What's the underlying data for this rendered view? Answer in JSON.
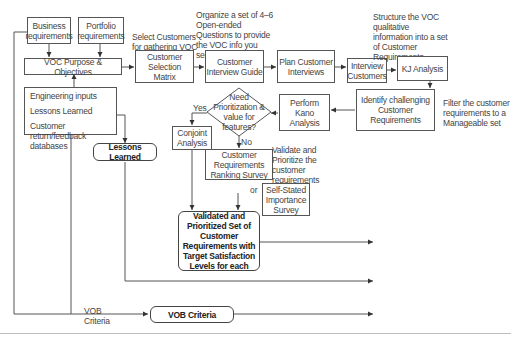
{
  "diagram": {
    "boxes": {
      "business_requirements": "Business requirements",
      "portfolio_requirements": "Portfolio requirements",
      "voc_purpose": "VOC Purpose & Objectives",
      "customer_selection_matrix": "Customer Selection Matrix",
      "customer_interview_guide": "Customer Interview Guide",
      "plan_customer_interviews": "Plan Customer Interviews",
      "interview_customers": "Interview Customers",
      "kj_analysis": "KJ Analysis",
      "identify_challenging": "Identify challenging Customer Requirements",
      "perform_kano": "Perform Kano Analysis",
      "conjoint_analysis": "Conjoint Analysis",
      "ranking_survey": "Customer Requirements Ranking Survey",
      "self_stated_survey": "Self-Stated Importance Survey",
      "lessons_learned_box": "Lessons Learned",
      "validated_set": "Validated and Prioritized Set of Customer Requirements with Target Satisfaction Levels for each",
      "vob_criteria_box": "VOB Criteria"
    },
    "inputs_list": [
      "Engineering inputs",
      "Lessons Learned",
      "Customer return/feedback databases"
    ],
    "decision": {
      "question": "Need Prioritization & value for features?",
      "yes": "Yes",
      "no": "No"
    },
    "notes": {
      "select_customers": "Select Customers for gathering VOC",
      "organize_questions": "Organize a set of 4–6 Open-ended Questions to provide the VOC info you seek",
      "structure_voc": "Structure the VOC qualitative information into a set of Customer Requirements",
      "filter_requirements": "Filter the customer requirements to a Manageable set",
      "validate_prioritize": "Validate and Prioritize the customer requirements",
      "or_label": "or",
      "vob_criteria_label": "VOB Criteria"
    }
  }
}
